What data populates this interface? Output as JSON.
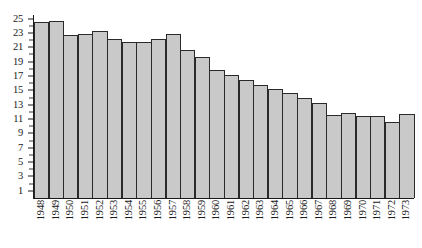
{
  "chart_data": {
    "type": "bar",
    "title": "",
    "subtitle": "",
    "xlabel": "",
    "ylabel": "",
    "grid": false,
    "legend": null,
    "xlim": [
      1948,
      1973
    ],
    "ylim": [
      0,
      25.5
    ],
    "y_ticks": [
      1,
      3,
      5,
      7,
      9,
      11,
      13,
      15,
      17,
      19,
      21,
      23,
      25
    ],
    "y_tick_labels": [
      "1",
      "3",
      "5",
      "7",
      "9",
      "11",
      "13",
      "15",
      "17",
      "19",
      "21",
      "23",
      "25"
    ],
    "y_minor_ticks": [
      2,
      4,
      6,
      8,
      10,
      12,
      14,
      16,
      18,
      20,
      22,
      24
    ],
    "categories": [
      "1948",
      "1949",
      "1950",
      "1951",
      "1952",
      "1953",
      "1954",
      "1955",
      "1956",
      "1957",
      "1958",
      "1959",
      "1960",
      "1961",
      "1962",
      "1963",
      "1964",
      "1965",
      "1966",
      "1967",
      "1968",
      "1969",
      "1970",
      "1971",
      "1972",
      "1973"
    ],
    "values": [
      24.5,
      24.6,
      22.7,
      22.8,
      23.3,
      22.1,
      21.7,
      21.7,
      22.2,
      22.9,
      20.6,
      19.6,
      17.8,
      17.2,
      16.5,
      15.7,
      15.2,
      14.7,
      14.0,
      13.2,
      11.5,
      11.9,
      11.4,
      11.4,
      10.6,
      11.7
    ],
    "bar_fill_color": "#c9c9c9",
    "bar_edge_color": "#2a2a2a",
    "axis_color": "#1a1a1a",
    "background_color": "#ffffff"
  }
}
